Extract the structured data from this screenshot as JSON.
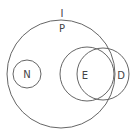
{
  "diagram": {
    "type": "euler",
    "stroke_color": "#666666",
    "background": "#ffffff",
    "outer_label": "I",
    "sets": [
      {
        "id": "P",
        "label": "P",
        "cx": 61,
        "cy": 74,
        "r": 54
      },
      {
        "id": "N",
        "label": "N",
        "cx": 27,
        "cy": 74,
        "r": 14
      },
      {
        "id": "E",
        "label": "E",
        "cx": 87,
        "cy": 74,
        "r": 27
      },
      {
        "id": "D",
        "label": "D",
        "cx": 103,
        "cy": 74,
        "r": 26
      }
    ],
    "labels": {
      "I": "I",
      "P": "P",
      "N": "N",
      "E": "E",
      "D": "D"
    }
  }
}
